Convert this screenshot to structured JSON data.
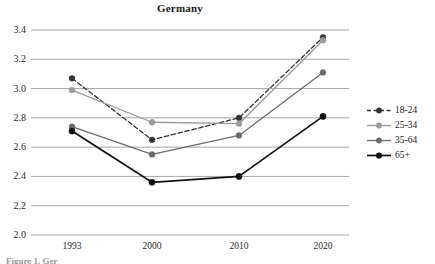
{
  "figure": {
    "title": "Germany",
    "footnote": "Figure 1. Ger"
  },
  "axes": {
    "y_ticks": [
      "3.4",
      "3.2",
      "3.0",
      "2.8",
      "2.6",
      "2.4",
      "2.2",
      "2.0"
    ],
    "x_ticks": [
      "1993",
      "2000",
      "2010",
      "2020"
    ]
  },
  "legend": {
    "items": [
      {
        "label": "18-24",
        "color": "#333333",
        "dash": "3,2"
      },
      {
        "label": "25-34",
        "color": "#9a9a9a",
        "dash": "none"
      },
      {
        "label": "35-64",
        "color": "#6b6b6b",
        "dash": "none"
      },
      {
        "label": "65+",
        "color": "#111111",
        "dash": "none"
      }
    ]
  },
  "chart_data": {
    "type": "line",
    "title": "Germany",
    "xlabel": "",
    "ylabel": "",
    "categories": [
      "1993",
      "2000",
      "2010",
      "2020"
    ],
    "x": [
      1993,
      2000,
      2010,
      2020
    ],
    "ylim": [
      2.0,
      3.4
    ],
    "yticks": [
      2.0,
      2.2,
      2.4,
      2.6,
      2.8,
      3.0,
      3.2,
      3.4
    ],
    "grid": "horizontal",
    "legend_position": "right",
    "markers": "filled-circle",
    "series": [
      {
        "name": "18-24",
        "values": [
          3.07,
          2.65,
          2.8,
          3.35
        ],
        "color": "#333333",
        "style": "dashed"
      },
      {
        "name": "25-34",
        "values": [
          2.99,
          2.77,
          2.76,
          3.33
        ],
        "color": "#9a9a9a",
        "style": "solid"
      },
      {
        "name": "35-64",
        "values": [
          2.74,
          2.55,
          2.68,
          3.11
        ],
        "color": "#6b6b6b",
        "style": "solid"
      },
      {
        "name": "65+",
        "values": [
          2.71,
          2.36,
          2.4,
          2.81
        ],
        "color": "#111111",
        "style": "solid"
      }
    ]
  }
}
